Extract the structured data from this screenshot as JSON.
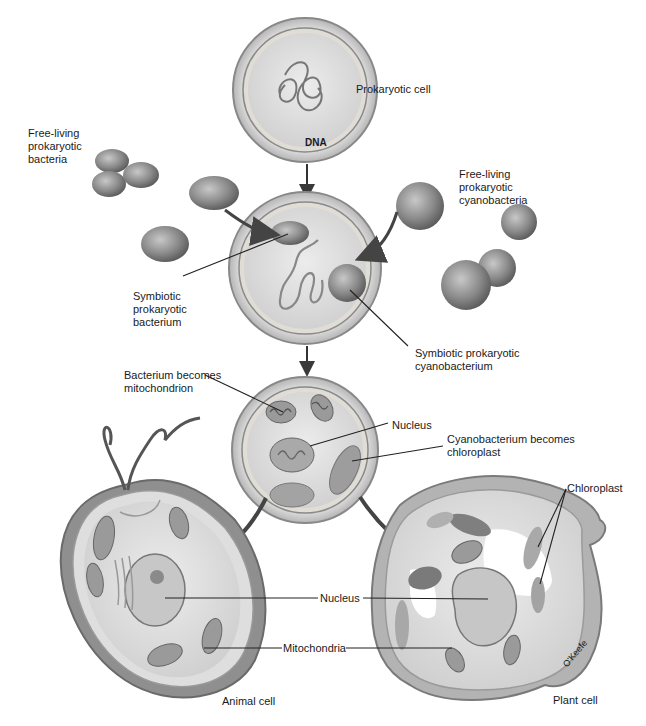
{
  "diagram": {
    "title_implied": "Endosymbiotic theory: origin of eukaryotic cells",
    "colors": {
      "background": "#ffffff",
      "cell_wall": "#b9b9b9",
      "cytoplasm": "#e4e4e4",
      "organelle": "#8d8d8d",
      "bacterium": "#7a7a7a",
      "line": "#222222",
      "text": "#1a1a1a"
    },
    "labels": {
      "prokaryotic_cell": "Prokaryotic cell",
      "dna": "DNA",
      "free_living_bacteria": "Free-living\nprokaryotic\nbacteria",
      "free_living_cyanobacteria": "Free-living\nprokaryotic\ncyanobacteria",
      "symbiotic_bacterium": "Symbiotic\nprokaryotic\nbacterium",
      "symbiotic_cyanobacterium": "Symbiotic prokaryotic\ncyanobacterium",
      "bacterium_becomes_mitochondrion": "Bacterium becomes\nmitochondrion",
      "nucleus_intermediate": "Nucleus",
      "cyanobacterium_becomes_chloroplast": "Cyanobacterium becomes\nchloroplast",
      "chloroplast": "Chloroplast",
      "nucleus_shared": "Nucleus",
      "mitochondria_shared": "Mitochondria",
      "animal_cell": "Animal cell",
      "plant_cell": "Plant cell",
      "artist_signature": "O'Keefe"
    },
    "flow": [
      "Prokaryotic cell",
      "Prokaryotic cell engulfs free-living bacterium and cyanobacterium",
      "Intermediate cell with mitochondria, nucleus, chloroplasts",
      "Animal cell",
      "Plant cell"
    ]
  }
}
